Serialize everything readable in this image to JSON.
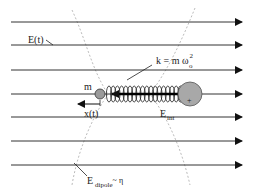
{
  "diagram": {
    "field_lines_y": [
      22,
      45,
      70,
      94,
      117,
      141,
      165
    ],
    "field_line_x_start": 11,
    "field_line_x_end": 242,
    "colors": {
      "line": "#333333",
      "dashed_circle": "#999999",
      "small_mass_fill": "#9a9a9a",
      "large_sphere_fill": "#a8a8a8",
      "spring": "#222222"
    }
  },
  "labels": {
    "e_field": "E(t)",
    "spring_constant_main": "k = m ω",
    "spring_constant_sup": "2",
    "spring_constant_sub": "o",
    "mass": "m",
    "displacement": "x(t)",
    "e_int_main": "E",
    "e_int_sub": "int",
    "e_dipole_main": "E",
    "e_dipole_sub": "dipole",
    "e_dipole_tail": "~ η",
    "plus_sign": "+"
  }
}
